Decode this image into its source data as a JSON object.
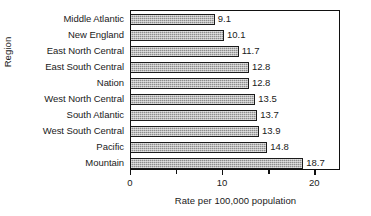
{
  "chart_data": {
    "type": "bar",
    "orientation": "horizontal",
    "title": "",
    "xlabel": "Rate per 100,000 population",
    "ylabel": "Region",
    "xlim": [
      0,
      22.8
    ],
    "xticks": [
      0,
      5,
      10,
      15,
      20
    ],
    "xtick_labels": [
      "0",
      "",
      "10",
      "",
      "20"
    ],
    "grid": false,
    "legend": null,
    "categories": [
      "Middle Atlantic",
      "New England",
      "East North Central",
      "East South Central",
      "Nation",
      "West North Central",
      "South Atlantic",
      "West South Central",
      "Pacific",
      "Mountain"
    ],
    "values": [
      9.1,
      10.1,
      11.7,
      12.8,
      12.8,
      13.5,
      13.7,
      13.9,
      14.8,
      18.7
    ],
    "value_labels": [
      "9.1",
      "10.1",
      "11.7",
      "12.8",
      "12.8",
      "13.5",
      "13.7",
      "13.9",
      "14.8",
      "18.7"
    ],
    "bar_color": "#8d8d8d",
    "bar_edge_color": "#1b1b1b",
    "frame_color": "#111111"
  }
}
